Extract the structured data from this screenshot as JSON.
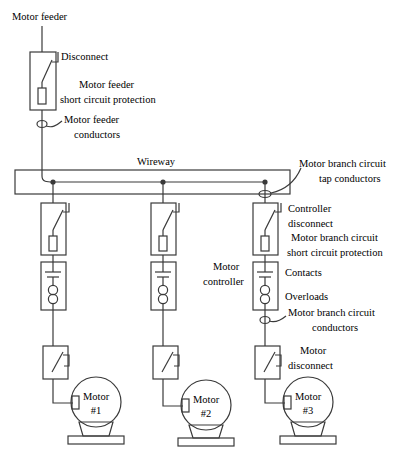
{
  "diagram": {
    "colors": {
      "line": "#3a3a3a",
      "text": "#000000",
      "background": "#ffffff"
    },
    "labels": {
      "motor_feeder": "Motor feeder",
      "disconnect": "Disconnect",
      "motor_feeder_scp_line1": "Motor feeder",
      "motor_feeder_scp_line2": "short circuit protection",
      "motor_feeder_conductors_line1": "Motor feeder",
      "motor_feeder_conductors_line2": "conductors",
      "wireway": "Wireway",
      "tap_conductors_line1": "Motor branch circuit",
      "tap_conductors_line2": "tap conductors",
      "controller_disconnect_line1": "Controller",
      "controller_disconnect_line2": "disconnect",
      "branch_scp_line1": "Motor branch circuit",
      "branch_scp_line2": "short circuit protection",
      "motor_controller_line1": "Motor",
      "motor_controller_line2": "controller",
      "contacts": "Contacts",
      "overloads": "Overloads",
      "branch_conductors_line1": "Motor branch circuit",
      "branch_conductors_line2": "conductors",
      "motor_disconnect_line1": "Motor",
      "motor_disconnect_line2": "disconnect"
    },
    "motors": [
      {
        "name_line1": "Motor",
        "name_line2": "#1",
        "column_x": 53
      },
      {
        "name_line1": "Motor",
        "name_line2": "#2",
        "column_x": 163
      },
      {
        "name_line1": "Motor",
        "name_line2": "#3",
        "column_x": 265
      }
    ]
  }
}
